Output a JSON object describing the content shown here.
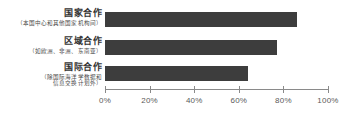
{
  "chart_data": {
    "type": "bar",
    "orientation": "horizontal",
    "title": "",
    "xlabel": "",
    "ylabel": "",
    "xlim": [
      0,
      100
    ],
    "grid": false,
    "legend": null,
    "bar_color": "#3d3d3d",
    "axis_color": "#8a8a8a",
    "tick_suffix": "%",
    "tick_labels": [
      "0%",
      "20%",
      "40%",
      "60%",
      "80%",
      "100%"
    ],
    "tick_values": [
      0,
      20,
      40,
      60,
      80,
      100
    ],
    "categories": [
      {
        "label": "国家合作",
        "sublabel_lines": [
          "（本国中心和其他国家机构间）"
        ]
      },
      {
        "label": "区域合作",
        "sublabel_lines": [
          "（如欧洲、非洲、东南亚）"
        ]
      },
      {
        "label": "国际合作",
        "sublabel_lines": [
          "（除国际海洋学数据和",
          "信息交换计划外）"
        ]
      }
    ],
    "values": [
      86,
      77,
      64
    ]
  }
}
